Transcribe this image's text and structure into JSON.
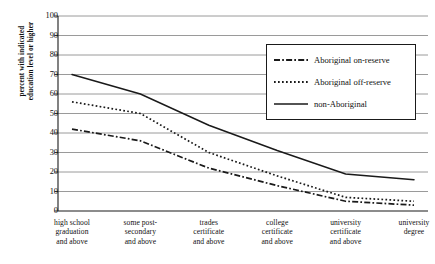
{
  "chart_data": {
    "type": "line",
    "title": "",
    "xlabel": "",
    "ylabel": "percent with indicated\neducation level or higher",
    "ylim": [
      0,
      100
    ],
    "ytick_step": 10,
    "grid": true,
    "legend_position": "upper-right",
    "categories": [
      "high school graduation and above",
      "some post-secondary and above",
      "trades certificate and above",
      "college certificate and above",
      "university certificate and above",
      "university degree"
    ],
    "category_lines": [
      [
        "high school",
        "graduation",
        "and above"
      ],
      [
        "some post-",
        "secondary",
        "and above"
      ],
      [
        "trades",
        "certificate",
        "and above"
      ],
      [
        "college",
        "certificate",
        "and above"
      ],
      [
        "university",
        "certificate",
        "and above"
      ],
      [
        "university",
        "degree"
      ]
    ],
    "yticks": [
      100,
      90,
      80,
      70,
      60,
      50,
      40,
      30,
      20,
      10,
      0
    ],
    "series": [
      {
        "name": "Aboriginal on-reserve",
        "style": "dash-dot",
        "color": "#1a1a1a",
        "values": [
          42,
          36,
          22,
          13,
          5,
          3
        ]
      },
      {
        "name": "Aboriginal off-reserve",
        "style": "dotted",
        "color": "#1a1a1a",
        "values": [
          56,
          50,
          30,
          18,
          7,
          5
        ]
      },
      {
        "name": "non-Aboriginal",
        "style": "solid",
        "color": "#1a1a1a",
        "values": [
          70,
          60,
          44,
          31,
          19,
          16
        ]
      }
    ]
  },
  "colors": {
    "axis": "#1a1a1a",
    "grid": "#808080",
    "background": "#ffffff",
    "legend_border": "#1a1a1a"
  }
}
